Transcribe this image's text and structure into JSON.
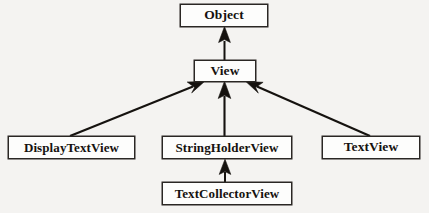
{
  "diagram": {
    "type": "class-inheritance-hierarchy",
    "notation": "UML generalization",
    "background_color": "#f4f3f1",
    "node_fill_color": "#fdfdfc",
    "line_color": "#15120f",
    "nodes": [
      {
        "id": "object",
        "label": "Object",
        "level": 1
      },
      {
        "id": "view",
        "label": "View",
        "level": 2
      },
      {
        "id": "display",
        "label": "DisplayTextView",
        "level": 3
      },
      {
        "id": "stringholder",
        "label": "StringHolderView",
        "level": 3
      },
      {
        "id": "text",
        "label": "TextView",
        "level": 3
      },
      {
        "id": "collector",
        "label": "TextCollectorView",
        "level": 4
      }
    ],
    "edges": [
      {
        "from": "view",
        "to": "object",
        "arrow": "solid-filled-triangle",
        "orientation": "vertical"
      },
      {
        "from": "display",
        "to": "view",
        "arrow": "solid-filled-triangle",
        "orientation": "diagonal-right-up"
      },
      {
        "from": "stringholder",
        "to": "view",
        "arrow": "solid-filled-triangle",
        "orientation": "vertical"
      },
      {
        "from": "text",
        "to": "view",
        "arrow": "solid-filled-triangle",
        "orientation": "diagonal-left-up"
      },
      {
        "from": "collector",
        "to": "stringholder",
        "arrow": "solid-filled-triangle",
        "orientation": "vertical"
      }
    ]
  }
}
